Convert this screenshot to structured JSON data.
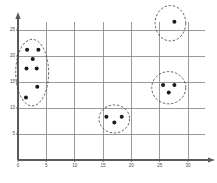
{
  "chart_data": {
    "type": "scatter",
    "title": "",
    "subtitle": "",
    "xlabel": "",
    "ylabel": "",
    "xlim": [
      0,
      32
    ],
    "ylim": [
      0,
      30
    ],
    "grid": true,
    "legend": null,
    "legend_position": "none",
    "x_ticks": [
      0,
      5,
      10,
      15,
      20,
      25,
      30
    ],
    "y_ticks": [
      5,
      10,
      15,
      20,
      25
    ],
    "x_tick_labels": [
      "0",
      "5",
      "10",
      "15",
      "20",
      "25",
      "30"
    ],
    "y_tick_labels": [
      "5",
      "10",
      "15",
      "20",
      "25"
    ],
    "axis_arrows": true,
    "marker": "filled-circle",
    "marker_color": "#1a1a1a",
    "marker_size": 2,
    "grid_color": "#8f8f8f",
    "axis_color": "#5a5a5a",
    "cluster_outline_color": "#3a3a3a",
    "cluster_outline_style": "dashed",
    "points": [
      {
        "x": 1.6,
        "y": 21.2
      },
      {
        "x": 3.6,
        "y": 21.2
      },
      {
        "x": 2.6,
        "y": 19.4
      },
      {
        "x": 1.5,
        "y": 17.6
      },
      {
        "x": 3.3,
        "y": 17.6
      },
      {
        "x": 3.4,
        "y": 14.1
      },
      {
        "x": 1.4,
        "y": 12.0
      },
      {
        "x": 15.6,
        "y": 8.3
      },
      {
        "x": 18.3,
        "y": 8.3
      },
      {
        "x": 17.0,
        "y": 7.2
      },
      {
        "x": 25.6,
        "y": 14.4
      },
      {
        "x": 27.6,
        "y": 14.4
      },
      {
        "x": 26.6,
        "y": 13.0
      },
      {
        "x": 27.6,
        "y": 26.6
      }
    ],
    "clusters": [
      {
        "name": "cluster-left",
        "shape": "ellipse",
        "cx": 2.5,
        "cy": 16.8,
        "rx": 2.9,
        "ry": 6.4,
        "n_points": 7
      },
      {
        "name": "cluster-bottom-middle",
        "shape": "circle",
        "cx": 17.0,
        "cy": 7.9,
        "rx": 2.7,
        "ry": 2.7,
        "n_points": 3
      },
      {
        "name": "cluster-right-middle",
        "shape": "circle",
        "cx": 26.6,
        "cy": 13.9,
        "rx": 3.0,
        "ry": 3.1,
        "n_points": 3
      },
      {
        "name": "cluster-top-right",
        "shape": "ellipse",
        "cx": 26.9,
        "cy": 26.3,
        "rx": 2.7,
        "ry": 3.4,
        "n_points": 1
      }
    ]
  },
  "figure": {
    "caption": "",
    "background_color": "#ffffff"
  }
}
